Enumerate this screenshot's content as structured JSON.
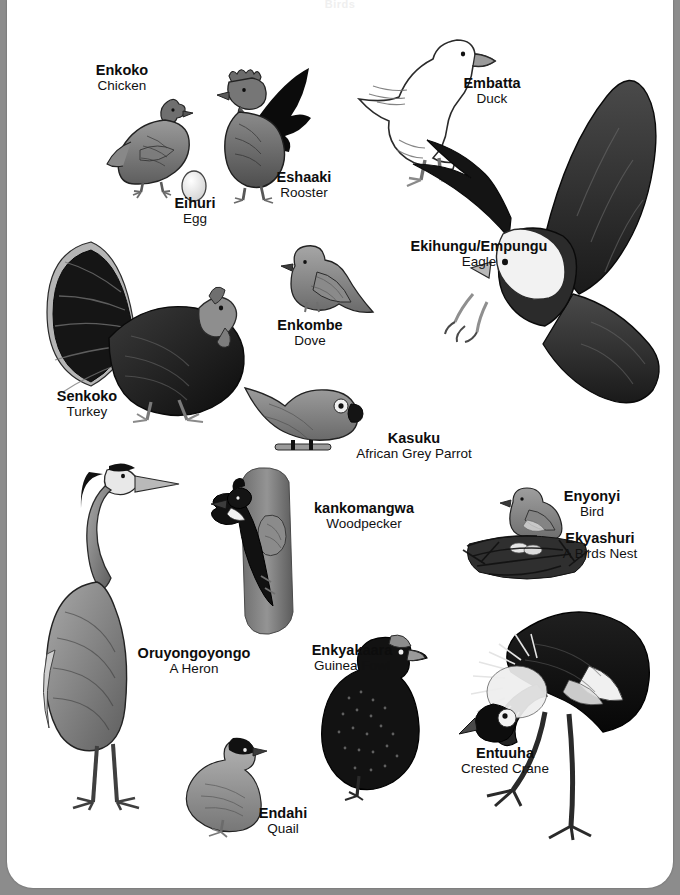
{
  "page": {
    "title": "Birds",
    "background_color": "#8c8c8c",
    "paper_color": "#ffffff"
  },
  "entries": [
    {
      "id": "chicken",
      "local": "Enkoko",
      "english": "Chicken",
      "icon": "chicken-illustration"
    },
    {
      "id": "egg",
      "local": "Eihuri",
      "english": "Egg",
      "icon": "egg-illustration"
    },
    {
      "id": "rooster",
      "local": "Eshaaki",
      "english": "Rooster",
      "icon": "rooster-illustration"
    },
    {
      "id": "duck",
      "local": "Embatta",
      "english": "Duck",
      "icon": "duck-illustration"
    },
    {
      "id": "eagle",
      "local": "Ekihungu/Empungu",
      "english": "Eagle",
      "icon": "eagle-illustration"
    },
    {
      "id": "turkey",
      "local": "Senkoko",
      "english": "Turkey",
      "icon": "turkey-illustration"
    },
    {
      "id": "dove",
      "local": "Enkombe",
      "english": "Dove",
      "icon": "dove-illustration"
    },
    {
      "id": "parrot",
      "local": "Kasuku",
      "english": "African Grey Parrot",
      "icon": "parrot-illustration"
    },
    {
      "id": "woodpecker",
      "local": "kankomangwa",
      "english": "Woodpecker",
      "icon": "woodpecker-illustration"
    },
    {
      "id": "bird",
      "local": "Enyonyi",
      "english": "Bird",
      "icon": "bird-illustration"
    },
    {
      "id": "nest",
      "local": "Ekyashuri",
      "english": "A Birds Nest",
      "icon": "nest-illustration"
    },
    {
      "id": "heron",
      "local": "Oruyongoyongo",
      "english": "A Heron",
      "icon": "heron-illustration"
    },
    {
      "id": "guineafowl",
      "local": "Enkyakaara",
      "english": "Guinea Fowl",
      "icon": "guinea-fowl-illustration"
    },
    {
      "id": "quail",
      "local": "Endahi",
      "english": "Quail",
      "icon": "quail-illustration"
    },
    {
      "id": "crane",
      "local": "Entuuha",
      "english": "Crested Crane",
      "icon": "crested-crane-illustration"
    }
  ]
}
